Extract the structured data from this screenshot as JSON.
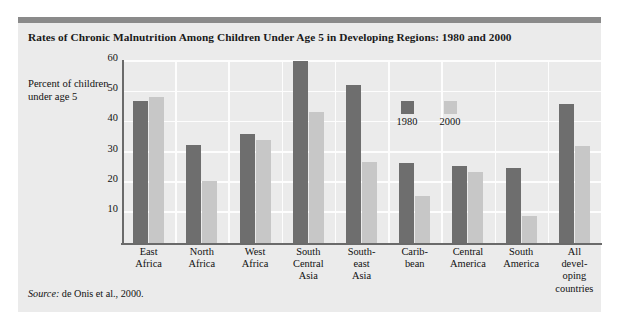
{
  "figure": {
    "title": "Rates of Chronic Malnutrition Among Children Under Age 5 in Developing Regions: 1980 and 2000",
    "y_axis_title": "Percent of children under age 5",
    "source_prefix": "Source:",
    "source_text": " de Onis et al., 2000.",
    "panel_color": "#ebebeb",
    "rule_color": "#8a8a8a"
  },
  "legend": {
    "position": "inside-top-right",
    "items": [
      {
        "label": "1980",
        "color": "#6e6e6e"
      },
      {
        "label": "2000",
        "color": "#c7c7c7"
      }
    ]
  },
  "chart_data": {
    "type": "bar",
    "title": "Rates of Chronic Malnutrition Among Children Under Age 5 in Developing Regions: 1980 and 2000",
    "xlabel": "",
    "ylabel": "Percent of children under age 5",
    "ylim": [
      0,
      60
    ],
    "yticks": [
      10,
      20,
      30,
      40,
      50,
      60
    ],
    "ytick_labels": [
      "10",
      "20",
      "30",
      "40",
      "50",
      "60"
    ],
    "grid": true,
    "grid_axis": "both",
    "categories": [
      "East Africa",
      "North Africa",
      "West Africa",
      "South Central Asia",
      "South-east Asia",
      "Carib-bean",
      "Central America",
      "South America",
      "All developing countries"
    ],
    "category_label_lines": [
      [
        "East",
        "Africa"
      ],
      [
        "North",
        "Africa"
      ],
      [
        "West",
        "Africa"
      ],
      [
        "South",
        "Central",
        "Asia"
      ],
      [
        "South-",
        "east",
        "Asia"
      ],
      [
        "Carib-",
        "bean"
      ],
      [
        "Central",
        "America"
      ],
      [
        "South",
        "America"
      ],
      [
        "All",
        "devel-",
        "oping",
        "countries"
      ]
    ],
    "series": [
      {
        "name": "1980",
        "color": "#6e6e6e",
        "values": [
          47,
          32.5,
          36,
          60.5,
          52.5,
          26.5,
          25.5,
          25,
          46
        ]
      },
      {
        "name": "2000",
        "color": "#c7c7c7",
        "values": [
          48.5,
          20.5,
          34,
          43.5,
          27,
          15.5,
          23.5,
          9,
          32
        ]
      }
    ]
  }
}
